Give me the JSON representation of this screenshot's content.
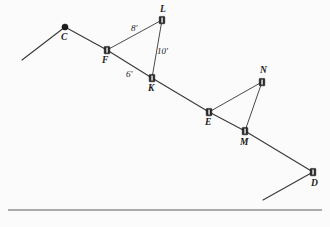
{
  "figure": {
    "background_color": "#fbfbfb",
    "line_color": "#3a3a3a",
    "node_color": "#2a2a2a",
    "points": [
      {
        "id": "C",
        "label": "C",
        "x": 65,
        "y": 27,
        "marker": "dot",
        "label_x": 61,
        "label_y": 33
      },
      {
        "id": "F",
        "label": "F",
        "x": 107,
        "y": 50,
        "marker": "rect",
        "label_x": 102,
        "label_y": 56
      },
      {
        "id": "L",
        "label": "L",
        "x": 162,
        "y": 20,
        "marker": "rect",
        "label_x": 160,
        "label_y": 5
      },
      {
        "id": "K",
        "label": "K",
        "x": 152,
        "y": 78,
        "marker": "rect",
        "label_x": 148,
        "label_y": 84
      },
      {
        "id": "E",
        "label": "E",
        "x": 209,
        "y": 112,
        "marker": "rect",
        "label_x": 205,
        "label_y": 118
      },
      {
        "id": "N",
        "label": "N",
        "x": 262,
        "y": 82,
        "marker": "rect",
        "label_x": 260,
        "label_y": 66
      },
      {
        "id": "M",
        "label": "M",
        "x": 245,
        "y": 131,
        "marker": "rect",
        "label_x": 240,
        "label_y": 138
      },
      {
        "id": "D",
        "label": "D",
        "x": 313,
        "y": 172,
        "marker": "rect",
        "label_x": 311,
        "label_y": 179
      }
    ],
    "dimensions": [
      {
        "id": "FL",
        "label": "8'",
        "x": 131,
        "y": 24
      },
      {
        "id": "LK",
        "label": "10'",
        "x": 157,
        "y": 47
      },
      {
        "id": "FK",
        "label": "6'",
        "x": 126,
        "y": 70
      }
    ],
    "segments": [
      {
        "id": "start-to-C",
        "from": [
          22,
          60
        ],
        "to": [
          65,
          27
        ]
      },
      {
        "id": "C-to-F",
        "from": [
          65,
          27
        ],
        "to": [
          107,
          50
        ]
      },
      {
        "id": "F-to-K",
        "from": [
          107,
          50
        ],
        "to": [
          152,
          78
        ]
      },
      {
        "id": "K-to-E",
        "from": [
          152,
          78
        ],
        "to": [
          209,
          112
        ]
      },
      {
        "id": "E-to-M",
        "from": [
          209,
          112
        ],
        "to": [
          245,
          131
        ]
      },
      {
        "id": "M-to-D",
        "from": [
          245,
          131
        ],
        "to": [
          313,
          172
        ]
      },
      {
        "id": "K-extend",
        "from": [
          152,
          78
        ],
        "to": [
          166,
          86
        ]
      },
      {
        "id": "F-to-L",
        "from": [
          107,
          50
        ],
        "to": [
          162,
          20
        ]
      },
      {
        "id": "L-to-K",
        "from": [
          162,
          20
        ],
        "to": [
          152,
          78
        ]
      },
      {
        "id": "E-to-N",
        "from": [
          209,
          112
        ],
        "to": [
          262,
          82
        ]
      },
      {
        "id": "N-to-M",
        "from": [
          262,
          82
        ],
        "to": [
          245,
          131
        ]
      },
      {
        "id": "D-to-lower-left",
        "from": [
          313,
          172
        ],
        "to": [
          263,
          200
        ]
      }
    ],
    "ground_line": {
      "id": "ground",
      "from": [
        8,
        210
      ],
      "to": [
        322,
        210
      ]
    }
  }
}
